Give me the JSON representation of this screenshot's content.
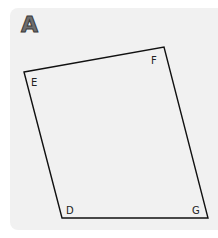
{
  "panel": {
    "label": "A",
    "background": "#f1f1f1"
  },
  "shape": {
    "type": "quadrilateral",
    "stroke": "#111111",
    "vertices": [
      {
        "name": "E",
        "x": 24,
        "y": 72
      },
      {
        "name": "F",
        "x": 164,
        "y": 47
      },
      {
        "name": "G",
        "x": 208,
        "y": 218
      },
      {
        "name": "D",
        "x": 62,
        "y": 218
      }
    ]
  },
  "labels": {
    "E": "E",
    "F": "F",
    "G": "G",
    "D": "D"
  }
}
